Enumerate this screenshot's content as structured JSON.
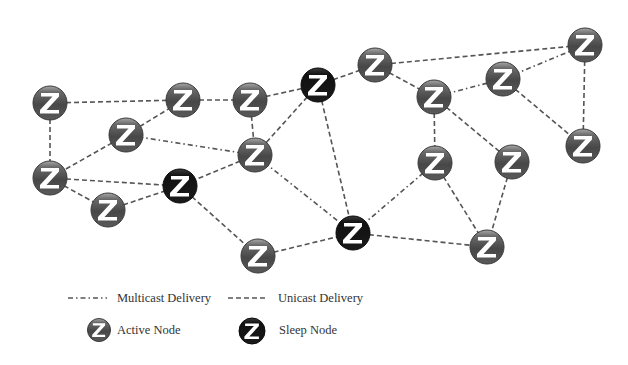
{
  "diagram": {
    "colors": {
      "background": "#ffffff",
      "edge": "#555555",
      "active_node_fill": "#4a4a4a",
      "active_node_top": "#9a9a9a",
      "sleep_node_fill": "#141414",
      "z_glyph": "#ffffff"
    },
    "node_radius": 17,
    "nodes": [
      {
        "id": "A",
        "x": 50,
        "y": 103,
        "type": "active"
      },
      {
        "id": "B",
        "x": 126,
        "y": 135,
        "type": "active"
      },
      {
        "id": "C",
        "x": 183,
        "y": 100,
        "type": "active"
      },
      {
        "id": "D",
        "x": 250,
        "y": 100,
        "type": "active"
      },
      {
        "id": "E",
        "x": 318,
        "y": 85,
        "type": "sleep"
      },
      {
        "id": "F",
        "x": 375,
        "y": 65,
        "type": "active"
      },
      {
        "id": "G",
        "x": 434,
        "y": 97,
        "type": "active"
      },
      {
        "id": "H",
        "x": 503,
        "y": 79,
        "type": "active"
      },
      {
        "id": "I",
        "x": 585,
        "y": 45,
        "type": "active"
      },
      {
        "id": "J",
        "x": 255,
        "y": 155,
        "type": "active"
      },
      {
        "id": "K",
        "x": 50,
        "y": 178,
        "type": "active"
      },
      {
        "id": "L",
        "x": 108,
        "y": 210,
        "type": "active"
      },
      {
        "id": "M",
        "x": 180,
        "y": 186,
        "type": "sleep"
      },
      {
        "id": "N",
        "x": 435,
        "y": 163,
        "type": "active"
      },
      {
        "id": "O",
        "x": 512,
        "y": 162,
        "type": "active"
      },
      {
        "id": "P",
        "x": 583,
        "y": 146,
        "type": "active"
      },
      {
        "id": "Q",
        "x": 353,
        "y": 233,
        "type": "sleep"
      },
      {
        "id": "R",
        "x": 258,
        "y": 256,
        "type": "active"
      },
      {
        "id": "S",
        "x": 487,
        "y": 247,
        "type": "active"
      }
    ],
    "edges": [
      {
        "from": "A",
        "to": "C",
        "type": "unicast"
      },
      {
        "from": "C",
        "to": "D",
        "type": "unicast"
      },
      {
        "from": "A",
        "to": "K",
        "type": "unicast"
      },
      {
        "from": "B",
        "to": "C",
        "type": "unicast"
      },
      {
        "from": "B",
        "to": "J",
        "type": "multicast"
      },
      {
        "from": "B",
        "to": "K",
        "type": "unicast"
      },
      {
        "from": "D",
        "to": "J",
        "type": "unicast"
      },
      {
        "from": "D",
        "to": "E",
        "type": "unicast"
      },
      {
        "from": "E",
        "to": "F",
        "type": "unicast"
      },
      {
        "from": "E",
        "to": "J",
        "type": "unicast"
      },
      {
        "from": "E",
        "to": "Q",
        "type": "unicast"
      },
      {
        "from": "F",
        "to": "I",
        "type": "unicast"
      },
      {
        "from": "F",
        "to": "G",
        "type": "unicast"
      },
      {
        "from": "G",
        "to": "H",
        "type": "multicast"
      },
      {
        "from": "H",
        "to": "I",
        "type": "multicast"
      },
      {
        "from": "I",
        "to": "P",
        "type": "unicast"
      },
      {
        "from": "H",
        "to": "P",
        "type": "unicast"
      },
      {
        "from": "G",
        "to": "N",
        "type": "unicast"
      },
      {
        "from": "G",
        "to": "O",
        "type": "unicast"
      },
      {
        "from": "J",
        "to": "M",
        "type": "unicast"
      },
      {
        "from": "J",
        "to": "Q",
        "type": "multicast"
      },
      {
        "from": "K",
        "to": "M",
        "type": "unicast"
      },
      {
        "from": "K",
        "to": "L",
        "type": "unicast"
      },
      {
        "from": "L",
        "to": "M",
        "type": "unicast"
      },
      {
        "from": "M",
        "to": "R",
        "type": "unicast"
      },
      {
        "from": "R",
        "to": "Q",
        "type": "unicast"
      },
      {
        "from": "Q",
        "to": "N",
        "type": "multicast"
      },
      {
        "from": "Q",
        "to": "S",
        "type": "unicast"
      },
      {
        "from": "N",
        "to": "S",
        "type": "unicast"
      },
      {
        "from": "O",
        "to": "S",
        "type": "unicast"
      }
    ]
  },
  "legend": {
    "multicast_label": "Multicast Delivery",
    "unicast_label": "Unicast Delivery",
    "active_label": "Active Node",
    "sleep_label": "Sleep Node"
  }
}
